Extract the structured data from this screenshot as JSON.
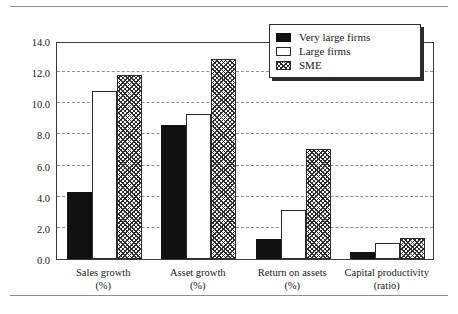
{
  "chart_data": {
    "type": "bar",
    "title": "",
    "xlabel": "",
    "ylabel": "Percent or ratio",
    "ylim": [
      0.0,
      14.0
    ],
    "ytick_step": 2.0,
    "ytick_labels": [
      "0.0",
      "2.0",
      "4.0",
      "6.0",
      "8.0",
      "10.0",
      "12.0",
      "14.0"
    ],
    "grid": "horizontal-dashed",
    "legend_position": "top-right",
    "categories": [
      {
        "line1": "Sales growth",
        "line2": "(%)"
      },
      {
        "line1": "Asset growth",
        "line2": "(%)"
      },
      {
        "line1": "Return on assets",
        "line2": "(%)"
      },
      {
        "line1": "Capital productivity",
        "line2": "(ratio)"
      }
    ],
    "series": [
      {
        "name": "Very large firms",
        "fill": "solid-black",
        "color": "#111111",
        "values": [
          4.3,
          8.6,
          1.3,
          0.45
        ]
      },
      {
        "name": "Large firms",
        "fill": "white-outline",
        "color": "#ffffff",
        "values": [
          10.8,
          9.3,
          3.15,
          1.05
        ]
      },
      {
        "name": "SME",
        "fill": "checker-hatch",
        "color": "#2f2f2f",
        "values": [
          11.8,
          12.85,
          7.05,
          1.35
        ]
      }
    ]
  },
  "figure": {
    "axis_color": "#3a3a3a",
    "grid_color": "#8f8f8f",
    "rule_color": "#8d8d8d"
  }
}
